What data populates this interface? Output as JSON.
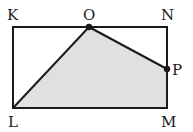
{
  "diagram": {
    "type": "geometry",
    "colors": {
      "stroke": "#1a1a1a",
      "shade": "#e0e0e0",
      "background": "#ffffff"
    },
    "labels": {
      "K": "K",
      "O": "O",
      "N": "N",
      "P": "P",
      "L": "L",
      "M": "M"
    },
    "shaded_region": [
      "L",
      "O",
      "P",
      "M"
    ],
    "rectangle": [
      "K",
      "N",
      "M",
      "L"
    ],
    "marked_points": [
      "O",
      "P"
    ]
  }
}
